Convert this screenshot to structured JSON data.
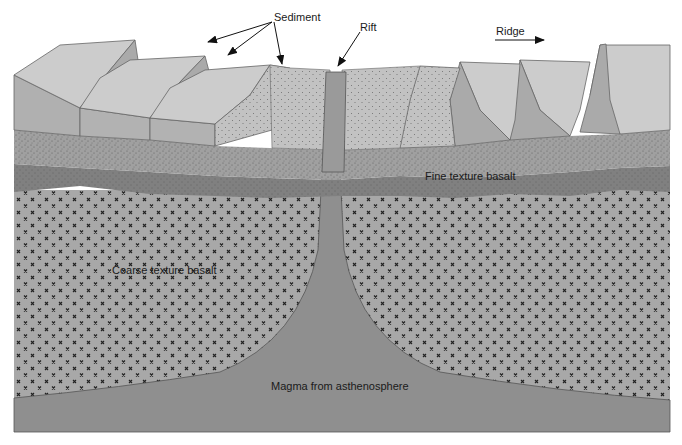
{
  "diagram": {
    "type": "cross-section"
  },
  "labels": {
    "sediment": "Sediment",
    "rift": "Rift",
    "ridge": "Ridge",
    "fine_basalt": "Fine texture basalt",
    "coarse_basalt": "Coarse texture basalt",
    "magma": "Magma from asthenosphere"
  },
  "colors": {
    "top_surface": "#c9c9c9",
    "block_face": "#a9a9a9",
    "sediment_layer": "#b4b4b4",
    "stippled_layer": "#9c9c9c",
    "dark_basalt": "#828282",
    "coarse_basalt": "#a6a6a6",
    "magma": "#8f8f8f",
    "cross_mark": "#222222"
  }
}
